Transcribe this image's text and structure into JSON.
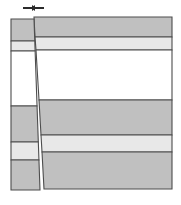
{
  "figure": {
    "title": "Two-column stratigraphic cross-section",
    "background_color": "#ffffff",
    "outline_color": "#4d4d4d",
    "width": 181,
    "height": 205
  },
  "palette": {
    "dark_gray": "#c0c0c0",
    "light_gray": "#e8e8e8",
    "white": "#ffffff",
    "marker_dark": "#2b2b2b",
    "stroke": "#4d4d4d"
  },
  "top_marker": {
    "name": "width-dimension-marker",
    "description": "small horizontal double-arrow tick marker",
    "left_dash": {
      "x": 23,
      "y": 7,
      "width": 9,
      "height": 2
    },
    "right_dash": {
      "x": 35,
      "y": 7,
      "width": 9,
      "height": 2
    },
    "left_head": {
      "points": "32,5 36,8 32,11"
    },
    "right_head": {
      "points": "35,5 31,8 35,11"
    }
  },
  "left_column": {
    "name": "left-narrow-column",
    "top_x_left": 11,
    "bottom_x_left": 11,
    "top_x_right": 34,
    "bottom_x_right": 40,
    "top_y": 19,
    "bottom_y": 190,
    "bands": [
      {
        "label": "L1",
        "fill": "dark_gray",
        "y_top": 19,
        "y_bottom": 41
      },
      {
        "label": "L2",
        "fill": "light_gray",
        "y_top": 41,
        "y_bottom": 51
      },
      {
        "label": "L3",
        "fill": "white",
        "y_top": 51,
        "y_bottom": 106
      },
      {
        "label": "L4",
        "fill": "dark_gray",
        "y_top": 106,
        "y_bottom": 142
      },
      {
        "label": "L5",
        "fill": "light_gray",
        "y_top": 142,
        "y_bottom": 160
      },
      {
        "label": "L6",
        "fill": "dark_gray",
        "y_top": 160,
        "y_bottom": 190
      }
    ]
  },
  "right_panel": {
    "name": "right-wide-panel",
    "x_right": 172,
    "top_y": 17,
    "bottom_y": 189,
    "bands": [
      {
        "label": "R1",
        "fill": "dark_gray",
        "y_top": 17,
        "y_bottom": 37,
        "x_left_top": 34,
        "x_left_bottom": 35
      },
      {
        "label": "R2",
        "fill": "light_gray",
        "y_top": 37,
        "y_bottom": 50,
        "x_left_top": 35,
        "x_left_bottom": 36
      },
      {
        "label": "R3",
        "fill": "white",
        "y_top": 50,
        "y_bottom": 100,
        "x_left_top": 36,
        "x_left_bottom": 39
      },
      {
        "label": "R4",
        "fill": "dark_gray",
        "y_top": 100,
        "y_bottom": 135,
        "x_left_top": 39,
        "x_left_bottom": 41
      },
      {
        "label": "R5",
        "fill": "light_gray",
        "y_top": 135,
        "y_bottom": 152,
        "x_left_top": 41,
        "x_left_bottom": 42
      },
      {
        "label": "R6",
        "fill": "dark_gray",
        "y_top": 152,
        "y_bottom": 189,
        "x_left_top": 42,
        "x_left_bottom": 44
      }
    ]
  }
}
